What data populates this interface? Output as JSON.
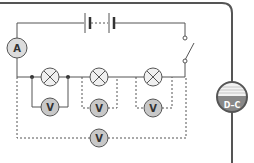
{
  "diagram": {
    "type": "electric-circuit",
    "components": {
      "battery": {
        "label": "battery",
        "cells": 2
      },
      "switch": {
        "label": "switch",
        "state": "open"
      },
      "ammeter": {
        "symbol": "A"
      },
      "lamps": [
        {
          "id": "lamp-1"
        },
        {
          "id": "lamp-2"
        },
        {
          "id": "lamp-3"
        }
      ],
      "voltmeters": [
        {
          "symbol": "V",
          "across": "lamp-1"
        },
        {
          "symbol": "V",
          "across": "lamp-2"
        },
        {
          "symbol": "V",
          "across": "lamp-3"
        },
        {
          "symbol": "V",
          "across": "all lamps"
        }
      ]
    },
    "badge": {
      "text": "D–C"
    },
    "colors": {
      "wire": "#555555",
      "frame": "#555555",
      "meter_fill": "#c8c8c8",
      "lamp_fill": "#f0f0f0",
      "badge_top": "#f2f2f2",
      "badge_bottom": "#888888"
    }
  }
}
